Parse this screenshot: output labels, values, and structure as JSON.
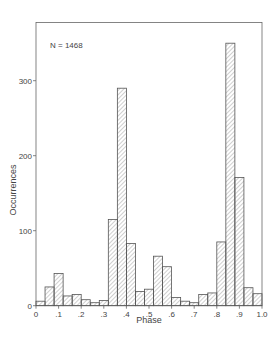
{
  "chart_data": {
    "type": "bar",
    "title": "",
    "annotation": "N = 1468",
    "xlabel": "Phase",
    "ylabel": "Occurrences",
    "xlim": [
      0,
      1.0
    ],
    "ylim": [
      0,
      370
    ],
    "bin_width": 0.04,
    "grid": false,
    "legend": null,
    "x_tick_labels": [
      "0",
      ".1",
      ".2",
      ".3",
      ".4",
      ".5",
      ".6",
      ".7",
      ".8",
      ".9",
      "1.0"
    ],
    "x_ticks": [
      0,
      0.1,
      0.2,
      0.3,
      0.4,
      0.5,
      0.6,
      0.7,
      0.8,
      0.9,
      1.0
    ],
    "y_tick_labels": [
      "0",
      "100",
      "200",
      "300"
    ],
    "y_ticks": [
      0,
      100,
      200,
      300
    ],
    "bin_starts": [
      0.0,
      0.04,
      0.08,
      0.12,
      0.16,
      0.2,
      0.24,
      0.28,
      0.32,
      0.36,
      0.4,
      0.44,
      0.48,
      0.52,
      0.56,
      0.6,
      0.64,
      0.68,
      0.72,
      0.76,
      0.8,
      0.84,
      0.88,
      0.92,
      0.96
    ],
    "values": [
      6,
      25,
      43,
      13,
      15,
      8,
      4,
      7,
      115,
      290,
      83,
      19,
      22,
      66,
      52,
      11,
      6,
      4,
      15,
      17,
      85,
      350,
      171,
      24,
      16
    ],
    "bar_fill": "hatched",
    "colors": {
      "stroke": "#555555",
      "hatch": "#777777",
      "background": "#ffffff"
    }
  }
}
